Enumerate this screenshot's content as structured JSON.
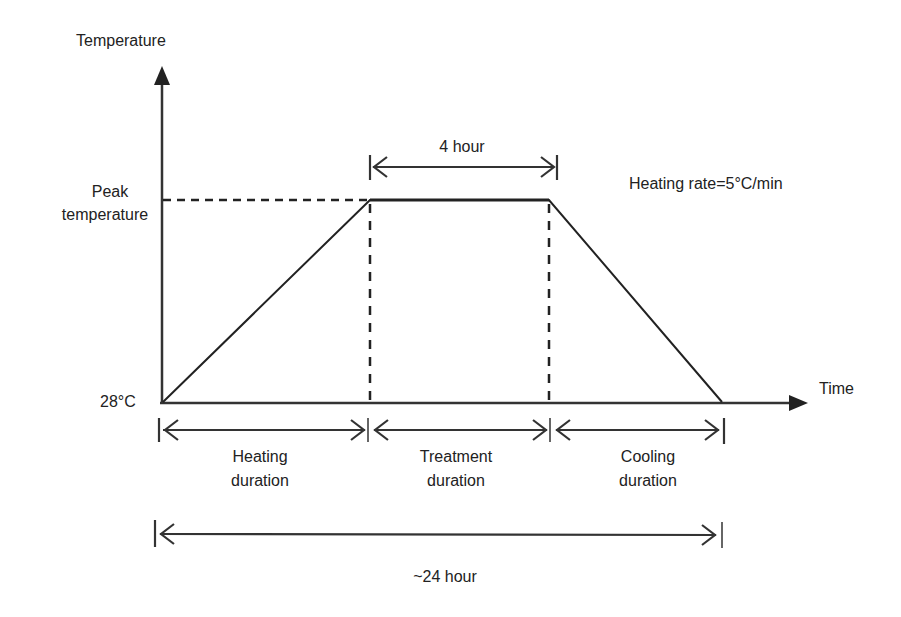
{
  "diagram": {
    "type": "temperature-time profile (heat treatment)",
    "axes": {
      "y_label": "Temperature",
      "x_label": "Time"
    },
    "y_ticks": {
      "peak_line1": "Peak",
      "peak_line2": "temperature",
      "base": "28°C"
    },
    "annotations": {
      "treatment_span": "4 hour",
      "heating_rate": "Heating rate=5°C/min",
      "total_span": "~24 hour"
    },
    "phases": [
      {
        "line1": "Heating",
        "line2": "duration"
      },
      {
        "line1": "Treatment",
        "line2": "duration"
      },
      {
        "line1": "Cooling",
        "line2": "duration"
      }
    ],
    "profile_points": [
      {
        "phase": "start",
        "time": "0",
        "temperature": "28°C"
      },
      {
        "phase": "end of heating",
        "temperature": "Peak temperature"
      },
      {
        "phase": "end of treatment",
        "temperature": "Peak temperature",
        "after": "4 hour"
      },
      {
        "phase": "end of cooling",
        "temperature": "28°C",
        "total": "~24 hour"
      }
    ],
    "colors": {
      "ink": "#222222",
      "background": "#ffffff"
    }
  }
}
